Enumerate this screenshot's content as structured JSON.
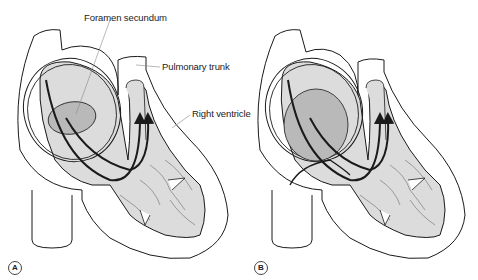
{
  "figure": {
    "panels": [
      {
        "id": "A",
        "badge": "A"
      },
      {
        "id": "B",
        "badge": "B"
      }
    ],
    "labels": {
      "foramen_secundum": "Foramen secundum",
      "pulmonary_trunk": "Pulmonary trunk",
      "right_ventricle": "Right ventricle"
    },
    "colors": {
      "outline": "#1a1a1a",
      "chamber_fill": "#dcdcdc",
      "foramen_fill": "#b9b9b9",
      "wall_fill": "#ffffff",
      "flow_arrow": "#1a1a1a",
      "leader_line": "#888888"
    }
  }
}
